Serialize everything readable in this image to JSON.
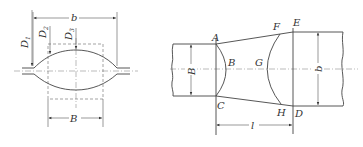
{
  "left_figure": {
    "labels": {
      "b": "b",
      "B": "B",
      "D1": "D",
      "D1_sub": "1",
      "D2": "D",
      "D2_sub": "2",
      "D3": "D",
      "D3_sub": "3"
    }
  },
  "right_figure": {
    "labels": {
      "A": "A",
      "B_point": "B",
      "C": "C",
      "D": "D",
      "E": "E",
      "F": "F",
      "G": "G",
      "H": "H",
      "B_width": "B",
      "b_width": "b",
      "l": "l"
    }
  },
  "colors": {
    "line": "#444444",
    "background": "#ffffff"
  }
}
